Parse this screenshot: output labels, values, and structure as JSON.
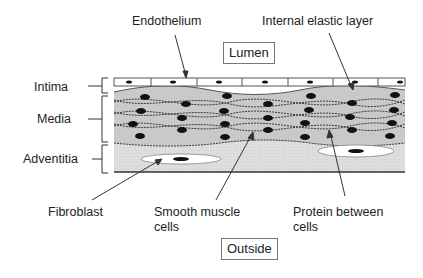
{
  "diagram": {
    "boxes": {
      "lumen": "Lumen",
      "outside": "Outside"
    },
    "layer_labels": {
      "intima": "Intima",
      "media": "Media",
      "adventitia": "Adventitia"
    },
    "callouts": {
      "endothelium": "Endothelium",
      "internal_elastic_layer": "Internal elastic layer",
      "fibroblast": "Fibroblast",
      "smooth_muscle_line1": "Smooth muscle",
      "smooth_muscle_line2": "cells",
      "protein_line1": "Protein between",
      "protein_line2": "cells"
    },
    "colors": {
      "media_fill": "#c8c8c8",
      "adventitia_fill": "#e4e4e4",
      "nucleus": "#111111",
      "line": "#333333"
    }
  }
}
